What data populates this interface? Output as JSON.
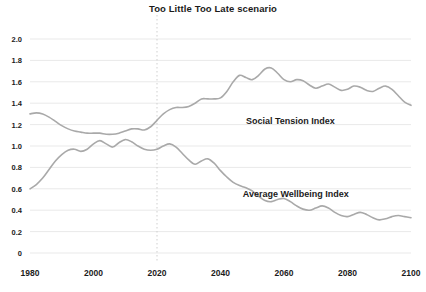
{
  "chart_data": {
    "type": "line",
    "title": "Too Little Too Late scenario",
    "xlabel": "",
    "ylabel": "",
    "xlim": [
      1980,
      2100
    ],
    "ylim": [
      0,
      2.0
    ],
    "grid": true,
    "legend_position": "inline-annotation",
    "x_ticks": [
      "1980",
      "2000",
      "2020",
      "2040",
      "2060",
      "2080",
      "2100"
    ],
    "x_tick_values": [
      1980,
      2000,
      2020,
      2040,
      2060,
      2080,
      2100
    ],
    "y_ticks": [
      "0",
      "0.2",
      "0.4",
      "0.6",
      "0.8",
      "1.0",
      "1.2",
      "1.4",
      "1.6",
      "1.8",
      "2.0"
    ],
    "y_tick_values": [
      0,
      0.2,
      0.4,
      0.6,
      0.8,
      1.0,
      1.2,
      1.4,
      1.6,
      1.8,
      2.0
    ],
    "annotations": [
      {
        "text": "Social Tension Index",
        "x": 2048,
        "y": 1.23
      },
      {
        "text": "Average Wellbeing Index",
        "x": 2047,
        "y": 0.55
      }
    ],
    "marker_lines": [
      {
        "type": "vertical",
        "value": 2020,
        "style": "dotted",
        "color": "#cfcfcf"
      }
    ],
    "line_color": "#a9a9a9",
    "line_width": 1.6,
    "x": [
      1980,
      1982,
      1984,
      1986,
      1988,
      1990,
      1992,
      1994,
      1996,
      1998,
      2000,
      2002,
      2004,
      2006,
      2008,
      2010,
      2012,
      2014,
      2016,
      2018,
      2020,
      2022,
      2024,
      2026,
      2028,
      2030,
      2032,
      2034,
      2036,
      2038,
      2040,
      2042,
      2044,
      2046,
      2048,
      2050,
      2052,
      2054,
      2056,
      2058,
      2060,
      2062,
      2064,
      2066,
      2068,
      2070,
      2072,
      2074,
      2076,
      2078,
      2080,
      2082,
      2084,
      2086,
      2088,
      2090,
      2092,
      2094,
      2096,
      2098,
      2100
    ],
    "series": [
      {
        "name": "Social Tension Index",
        "color": "#a9a9a9",
        "values": [
          1.3,
          1.31,
          1.3,
          1.27,
          1.23,
          1.19,
          1.16,
          1.14,
          1.13,
          1.12,
          1.12,
          1.12,
          1.11,
          1.11,
          1.12,
          1.14,
          1.16,
          1.16,
          1.15,
          1.18,
          1.24,
          1.3,
          1.34,
          1.36,
          1.36,
          1.37,
          1.4,
          1.44,
          1.44,
          1.44,
          1.45,
          1.51,
          1.6,
          1.66,
          1.64,
          1.62,
          1.66,
          1.72,
          1.73,
          1.68,
          1.62,
          1.6,
          1.62,
          1.61,
          1.57,
          1.54,
          1.56,
          1.58,
          1.55,
          1.52,
          1.53,
          1.56,
          1.55,
          1.52,
          1.51,
          1.54,
          1.56,
          1.53,
          1.47,
          1.41,
          1.38
        ]
      },
      {
        "name": "Average Wellbeing Index",
        "color": "#a9a9a9",
        "values": [
          0.6,
          0.64,
          0.7,
          0.78,
          0.86,
          0.92,
          0.96,
          0.97,
          0.95,
          0.97,
          1.02,
          1.05,
          1.02,
          0.99,
          1.03,
          1.06,
          1.04,
          1.0,
          0.97,
          0.96,
          0.97,
          1.0,
          1.02,
          0.99,
          0.93,
          0.87,
          0.83,
          0.86,
          0.88,
          0.84,
          0.77,
          0.71,
          0.66,
          0.63,
          0.61,
          0.58,
          0.53,
          0.49,
          0.48,
          0.5,
          0.51,
          0.48,
          0.44,
          0.41,
          0.4,
          0.42,
          0.44,
          0.42,
          0.38,
          0.35,
          0.34,
          0.36,
          0.38,
          0.36,
          0.33,
          0.31,
          0.32,
          0.34,
          0.35,
          0.34,
          0.33
        ]
      }
    ]
  }
}
